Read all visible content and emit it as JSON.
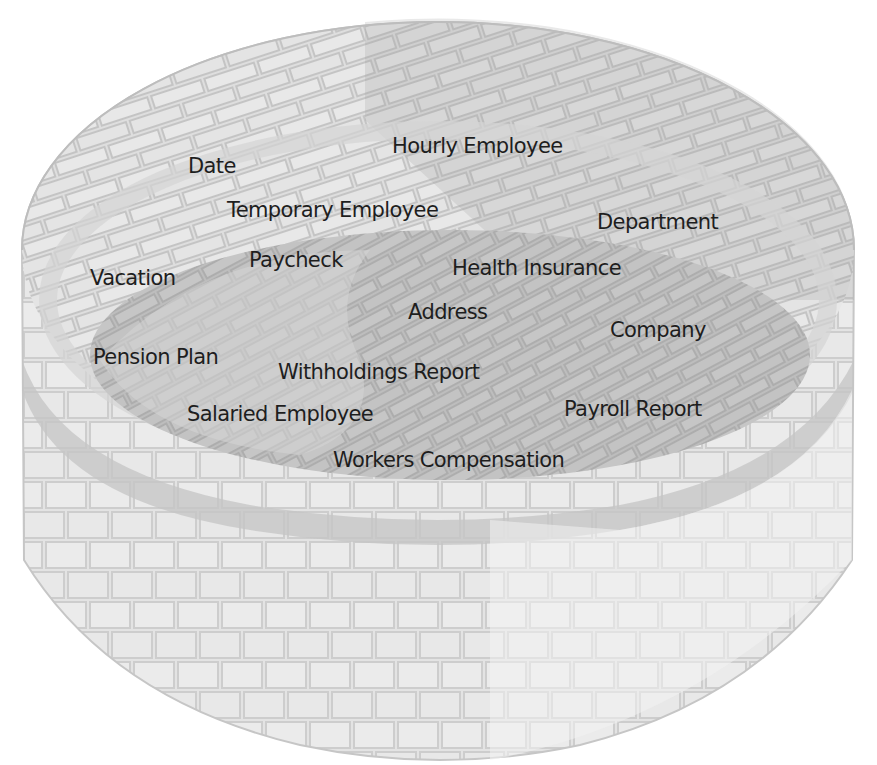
{
  "diagram": {
    "type": "well-of-concepts",
    "colors": {
      "background": "#ffffff",
      "wall_light": "#e6e6e6",
      "wall_mid": "#d9d9d9",
      "wall_dark": "#c9c9c9",
      "floor": "#bdbdbd",
      "floor_light": "#cfcfcf",
      "mortar": "#b8b8b8",
      "text": "#1e1e1e"
    },
    "labels": [
      {
        "text": "Hourly Employee",
        "x": 392,
        "y": 136
      },
      {
        "text": "Date",
        "x": 188,
        "y": 156
      },
      {
        "text": "Temporary Employee",
        "x": 227,
        "y": 200
      },
      {
        "text": "Department",
        "x": 597,
        "y": 212
      },
      {
        "text": "Paycheck",
        "x": 249,
        "y": 250
      },
      {
        "text": "Health Insurance",
        "x": 452,
        "y": 258
      },
      {
        "text": "Vacation",
        "x": 90,
        "y": 268
      },
      {
        "text": "Address",
        "x": 408,
        "y": 302
      },
      {
        "text": "Company",
        "x": 610,
        "y": 320
      },
      {
        "text": "Pension Plan",
        "x": 93,
        "y": 347
      },
      {
        "text": "Withholdings Report",
        "x": 278,
        "y": 362
      },
      {
        "text": "Payroll Report",
        "x": 564,
        "y": 399
      },
      {
        "text": "Salaried Employee",
        "x": 187,
        "y": 404
      },
      {
        "text": "Workers Compensation",
        "x": 333,
        "y": 450
      }
    ]
  }
}
